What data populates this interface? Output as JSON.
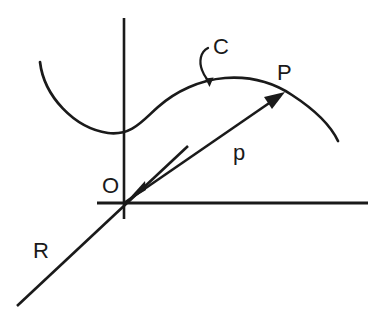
{
  "figure": {
    "kind": "geometry-diagram",
    "background_color": "#ffffff",
    "stroke_color": "#1a1a1a",
    "labels": {
      "curve": "C",
      "point": "P",
      "vector": "p",
      "origin": "O",
      "line": "R"
    },
    "elements": {
      "curve_c": "curve-C",
      "vector_p": "vector-p-arrow",
      "line_r": "line-R",
      "axis_vertical": "vertical-axis",
      "axis_horizontal": "horizontal-axis",
      "leader_c": "leader-line-C"
    },
    "geometry": {
      "origin": [
        124,
        203
      ],
      "point_p": [
        283,
        93
      ],
      "vertical_axis": [
        124,
        18,
        124,
        219
      ],
      "horizontal_axis": [
        97,
        203,
        368,
        203
      ],
      "line_r_start": [
        17,
        306
      ],
      "line_r_end": [
        186,
        148
      ],
      "curve_start": [
        40,
        62
      ],
      "curve_end": [
        338,
        141
      ]
    }
  }
}
